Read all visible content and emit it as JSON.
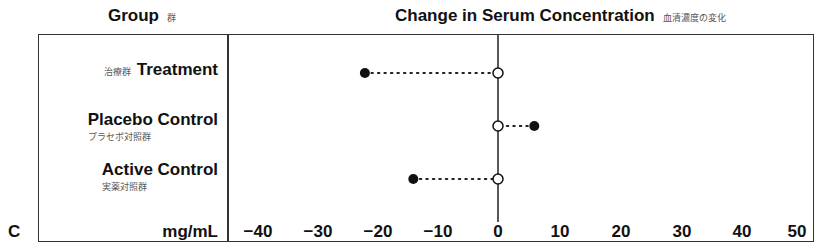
{
  "header": {
    "group_label": "Group",
    "group_label_jp": "群",
    "metric_label": "Change in Serum Concentration",
    "metric_label_jp": "血清濃度の変化"
  },
  "panel_letter": "C",
  "unit": "mg/mL",
  "groups": [
    {
      "name": "Treatment",
      "name_jp": "治療群"
    },
    {
      "name": "Placebo Control",
      "name_jp": "プラセボ対照群"
    },
    {
      "name": "Active Control",
      "name_jp": "実薬対照群"
    }
  ],
  "ticks": [
    "−40",
    "−30",
    "−20",
    "−10",
    "0",
    "10",
    "20",
    "30",
    "40",
    "50"
  ],
  "chart_data": {
    "type": "scatter",
    "subtype": "dot-and-line change plot",
    "title": "Change in Serum Concentration",
    "title_jp": "血清濃度の変化",
    "xlabel": "mg/mL",
    "ylabel": "Group",
    "categories": [
      "Treatment",
      "Placebo Control",
      "Active Control"
    ],
    "series": [
      {
        "name": "Baseline (open circle)",
        "values": [
          0,
          0,
          0
        ]
      },
      {
        "name": "Change (filled circle)",
        "values": [
          -22,
          6,
          -14
        ]
      }
    ],
    "xlim": [
      -45,
      50
    ],
    "xticks": [
      -40,
      -30,
      -20,
      -10,
      0,
      10,
      20,
      30,
      40,
      50
    ],
    "grid": false,
    "reference_line": 0,
    "connector": "dotted"
  }
}
